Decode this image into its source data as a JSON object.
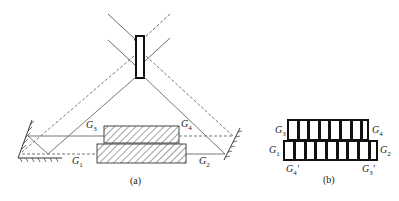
{
  "figure_a": {
    "caption": "(a)",
    "labels": {
      "g1": "G",
      "g1_sub": "1",
      "g2": "G",
      "g2_sub": "2",
      "g3": "G",
      "g3_sub": "3",
      "g4": "G",
      "g4_sub": "4"
    }
  },
  "figure_b": {
    "caption": "(b)",
    "labels": {
      "g1": "G",
      "g1_sub": "1",
      "g2": "G",
      "g2_sub": "2",
      "g3": "G",
      "g3_sub": "3",
      "g4": "G",
      "g4_sub": "4",
      "g4p": "G",
      "g4p_sub": "4",
      "g3p": "G",
      "g3p_sub": "3",
      "prime": "′"
    }
  },
  "colors": {
    "line": "#555555",
    "frame": "#111111"
  }
}
